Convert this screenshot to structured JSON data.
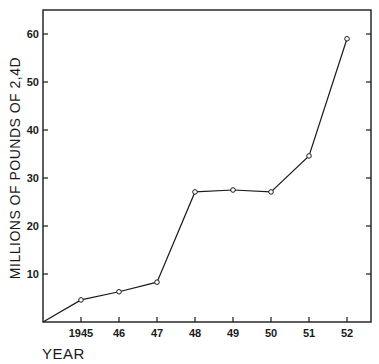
{
  "chart_data": {
    "type": "line",
    "title": "",
    "xlabel": "YEAR",
    "ylabel": "MILLIONS OF POUNDS OF 2,4D",
    "x_tick_labels": [
      "1945",
      "46",
      "47",
      "48",
      "49",
      "50",
      "51",
      "52"
    ],
    "y_tick_labels": [
      "10",
      "20",
      "30",
      "40",
      "50",
      "60"
    ],
    "x": [
      1945,
      1946,
      1947,
      1948,
      1949,
      1950,
      1951,
      1952
    ],
    "series": [
      {
        "name": "2,4-D production",
        "values": [
          4.6,
          6.3,
          8.3,
          27.1,
          27.5,
          27.1,
          34.6,
          59.0
        ],
        "marker": "open-circle",
        "starts_from_origin": true
      }
    ],
    "xlim": [
      1944,
      1952.6
    ],
    "ylim": [
      0,
      65
    ],
    "grid": false,
    "legend": null,
    "frame": "box with ticks on left and right"
  }
}
